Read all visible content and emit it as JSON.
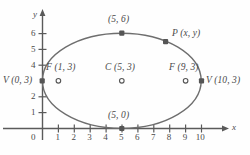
{
  "figure": {
    "type": "ellipse-diagram",
    "axes": {
      "x_name": "x",
      "y_name": "y",
      "origin_label": "0",
      "x_ticks": [
        "1",
        "2",
        "3",
        "4",
        "5",
        "6",
        "7",
        "8",
        "9",
        "10"
      ],
      "x_tick_values": [
        1,
        2,
        3,
        4,
        5,
        6,
        7,
        8,
        9,
        10
      ],
      "y_ticks": [
        "1",
        "2",
        "4",
        "5",
        "6"
      ],
      "y_tick_values": [
        1,
        2,
        4,
        5,
        6
      ],
      "x_range": [
        0,
        10
      ],
      "y_range": [
        0,
        6
      ]
    },
    "curve": {
      "name": "ellipse",
      "center": [
        5,
        3
      ],
      "semi_major_x": 5,
      "semi_minor_y": 3,
      "stroke": "#6e6e6e"
    },
    "points": [
      {
        "id": "vertex-left",
        "label": "V (0, 3)",
        "value": [
          0,
          3
        ],
        "marker": "filled",
        "label_pos": "left"
      },
      {
        "id": "vertex-right",
        "label": "V (10, 3)",
        "value": [
          10,
          3
        ],
        "marker": "filled",
        "label_pos": "right"
      },
      {
        "id": "covertex-top",
        "label": "(5, 6)",
        "value": [
          5,
          6
        ],
        "marker": "filled",
        "label_pos": "above"
      },
      {
        "id": "covertex-bottom",
        "label": "(5, 0)",
        "value": [
          5,
          0
        ],
        "marker": "filled",
        "label_pos": "above"
      },
      {
        "id": "point-p",
        "label": "P (x, y)",
        "value": [
          7.7,
          5.5
        ],
        "marker": "filled",
        "label_pos": "right"
      },
      {
        "id": "focus-left",
        "label": "F (1, 3)",
        "value": [
          1,
          3
        ],
        "marker": "open",
        "label_pos": "above"
      },
      {
        "id": "center",
        "label": "C (5, 3)",
        "value": [
          5,
          3
        ],
        "marker": "open",
        "label_pos": "above"
      },
      {
        "id": "focus-right",
        "label": "F (9, 3)",
        "value": [
          9,
          3
        ],
        "marker": "open",
        "label_pos": "above"
      }
    ],
    "colors": {
      "ink": "#4a4a4a",
      "curve": "#6e6e6e",
      "axis": "#5a5a5a",
      "marker": "#555555",
      "background": "#fefefe"
    }
  }
}
